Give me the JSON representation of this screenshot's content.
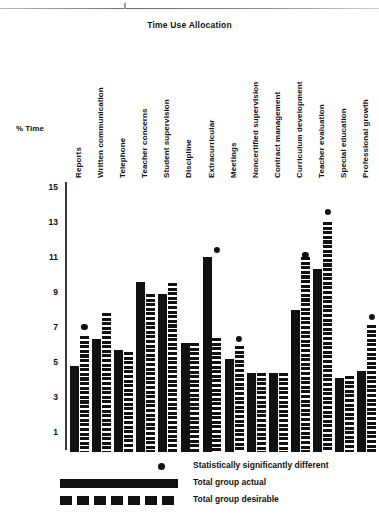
{
  "chart_data": {
    "type": "bar",
    "title": "Time Use Allocation",
    "xlabel": "",
    "ylabel": "% Time",
    "ylim": [
      1,
      15
    ],
    "yticks": [
      15,
      13,
      11,
      9,
      7,
      5,
      3,
      1
    ],
    "grid": false,
    "legend_position": "bottom",
    "categories": [
      "Reports",
      "Written communication",
      "Telephone",
      "Teacher concerns",
      "Student supervision",
      "Discipline",
      "Extracurricular",
      "Meetings",
      "Noncertified supervision",
      "Contract management",
      "Curriculum development",
      "Teacher evaluation",
      "Special education",
      "Professional growth"
    ],
    "series": [
      {
        "name": "Total group actual",
        "style": "solid",
        "values": [
          4.8,
          6.3,
          5.7,
          9.6,
          8.9,
          6.1,
          11.0,
          5.2,
          4.4,
          4.4,
          8.0,
          10.3,
          4.1,
          4.5
        ]
      },
      {
        "name": "Total group desirable",
        "style": "dashed",
        "values": [
          6.5,
          7.8,
          5.6,
          8.9,
          9.5,
          6.1,
          6.4,
          5.9,
          4.4,
          4.4,
          11.0,
          13.0,
          4.2,
          7.1
        ]
      }
    ],
    "significance_marker": {
      "label": "Statistically significantly different",
      "marker": "dot",
      "categories": [
        "Reports",
        "Extracurricular",
        "Meetings",
        "Curriculum development",
        "Teacher evaluation",
        "Professional growth"
      ],
      "values": [
        7.0,
        11.4,
        6.3,
        11.1,
        13.6,
        7.6
      ]
    }
  },
  "legend": {
    "rows": [
      {
        "key": "dot",
        "label": "Statistically significantly different"
      },
      {
        "key": "solid",
        "label": "Total group actual"
      },
      {
        "key": "dashed",
        "label": "Total group desirable"
      }
    ]
  }
}
